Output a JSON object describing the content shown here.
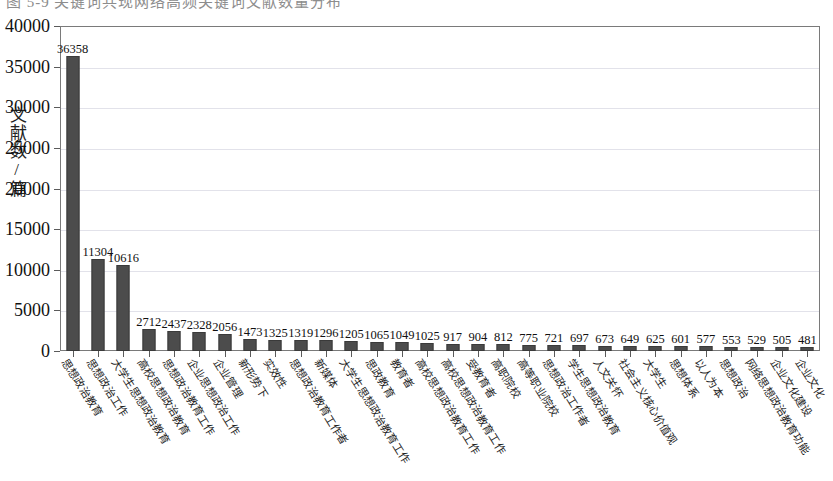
{
  "top_caption_fragment": "图 5-9  关键词共现网络高频关键词文献数量分布",
  "chart_data": {
    "type": "bar",
    "title": "",
    "xlabel": "",
    "ylabel": "文献数/篇",
    "ylim": [
      0,
      40000
    ],
    "ytick_labels": [
      "0",
      "5000",
      "10000",
      "15000",
      "20000",
      "25000",
      "30000",
      "35000",
      "40000"
    ],
    "ytick_values": [
      0,
      5000,
      10000,
      15000,
      20000,
      25000,
      30000,
      35000,
      40000
    ],
    "grid": true,
    "legend": "none",
    "bar_color": "#4c4c4c",
    "categories": [
      "思想政治教育",
      "思想政治工作",
      "大学生思想政治教育",
      "高校思想政治教育",
      "思想政治教育工作",
      "企业思想政治工作",
      "企业管理",
      "新形势下",
      "实效性",
      "思想政治教育工作者",
      "新媒体",
      "大学生思想政治教育工作",
      "思政教育",
      "教育者",
      "高校思想政治教育工作",
      "高校思想政治教育工作",
      "受教育者",
      "高职院校",
      "高等职业院校",
      "思想政治工作",
      "学生思想政治教育",
      "人文关怀",
      "社会主义核心价值观",
      "大学生",
      "思想体系",
      "以人为本",
      "思想政治",
      "网络思想政治教育功能",
      "企业文化建设"
    ],
    "values": [
      36358,
      11304,
      10616,
      2712,
      2437,
      2328,
      2056,
      1473,
      1325,
      1319,
      1296,
      1205,
      1065,
      1049,
      1025,
      917,
      904,
      812,
      775,
      721,
      697,
      673,
      649,
      625,
      601,
      577,
      553,
      529,
      505
    ],
    "values_extra_tail": [
      481
    ],
    "all_values": [
      36358,
      11304,
      10616,
      2712,
      2437,
      2328,
      2056,
      1473,
      1325,
      1319,
      1296,
      1205,
      1065,
      1049,
      1025,
      917,
      904,
      812,
      775,
      721,
      697,
      673,
      649,
      625,
      601,
      577,
      553,
      529,
      505,
      481
    ],
    "all_categories": [
      "思想政治教育",
      "思想政治工作",
      "大学生思想政治教育",
      "高校思想政治教育",
      "思想政治教育工作",
      "企业思想政治工作",
      "企业管理",
      "新形势下",
      "实效性",
      "思想政治教育工作者",
      "新媒体",
      "大学生思想政治教育工作",
      "思政教育",
      "教育者",
      "高校思想政治教育工作",
      "高校思想政治教育工作",
      "受教育者",
      "高职院校",
      "高等职业院校",
      "思想政治工作者",
      "学生思想政治教育",
      "人文关怀",
      "社会主义核心价值观",
      "大学生",
      "思想体系",
      "以人为本",
      "思想政治",
      "网络思想政治教育功能",
      "企业文化建设",
      "企业文化"
    ]
  }
}
